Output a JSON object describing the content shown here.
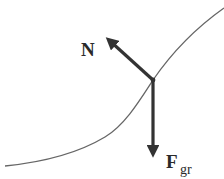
{
  "diagram": {
    "type": "free-body-diagram",
    "curve": {
      "description": "S-shaped slope curve",
      "color": "#555555"
    },
    "point": {
      "x": 153,
      "y": 80
    },
    "forces": [
      {
        "id": "normal",
        "label": "N",
        "subscript": "",
        "direction": "up-left, perpendicular to curve"
      },
      {
        "id": "gravity",
        "label": "F",
        "subscript": "gr",
        "direction": "straight down"
      }
    ],
    "arrow_color": "#333333"
  }
}
